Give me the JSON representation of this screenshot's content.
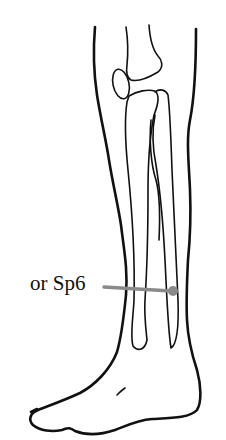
{
  "figure": {
    "annotation": {
      "label": "or Sp6",
      "pointer_color": "#8a8a8a",
      "point_color": "#8a8a8a"
    }
  }
}
